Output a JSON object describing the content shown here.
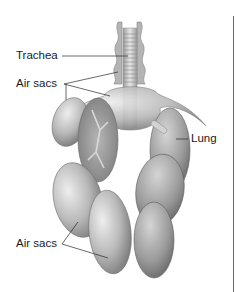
{
  "diagram": {
    "labels": {
      "trachea": "Trachea",
      "air_sacs_upper": "Air sacs",
      "lung": "Lung",
      "air_sacs_lower": "Air sacs"
    },
    "colors": {
      "background": "#ffffff",
      "organ_light": "#d8d8d8",
      "organ_mid": "#a9a9a9",
      "organ_dark": "#6e6e6e",
      "leader_line": "#2a2a2a",
      "text": "#1a1a1a"
    }
  }
}
